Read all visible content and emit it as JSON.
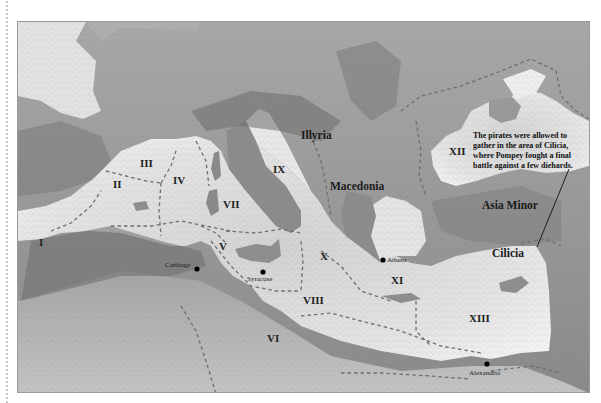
{
  "map": {
    "title": "Pompey's campaign against the pirates — thirteen naval districts",
    "regions": [
      {
        "id": "I",
        "label": "I"
      },
      {
        "id": "II",
        "label": "II"
      },
      {
        "id": "III",
        "label": "III"
      },
      {
        "id": "IV",
        "label": "IV"
      },
      {
        "id": "V",
        "label": "V"
      },
      {
        "id": "VI",
        "label": "VI"
      },
      {
        "id": "VII",
        "label": "VII"
      },
      {
        "id": "VIII",
        "label": "VIII"
      },
      {
        "id": "IX",
        "label": "IX"
      },
      {
        "id": "X",
        "label": "X"
      },
      {
        "id": "XI",
        "label": "XI"
      },
      {
        "id": "XII",
        "label": "XII"
      },
      {
        "id": "XIII",
        "label": "XIII"
      }
    ],
    "places": [
      {
        "name": "Illyria"
      },
      {
        "name": "Macedonia"
      },
      {
        "name": "Asia Minor"
      },
      {
        "name": "Cilicia"
      }
    ],
    "cities": [
      {
        "name": "Carthage"
      },
      {
        "name": "Syracuse"
      },
      {
        "name": "Athens"
      },
      {
        "name": "Alexandria"
      }
    ],
    "annotation": {
      "lines": [
        "The pirates were allowed to",
        "gather in the area of Cilicia,",
        "where Pompey fought a final",
        "battle against a few diehards."
      ]
    },
    "colors": {
      "sea": "#e6e6e6",
      "land": "#9c9c9c",
      "mountains": "#5f5f5f",
      "boundary": "#6e6e6e",
      "text": "#1a1a1a"
    }
  }
}
